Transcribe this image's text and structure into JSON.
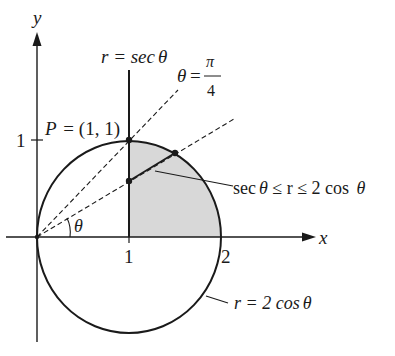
{
  "figure": {
    "axes": {
      "x_label": "x",
      "y_label": "y",
      "x_ticks": [
        {
          "value": 1,
          "label": "1"
        },
        {
          "value": 2,
          "label": "2"
        }
      ],
      "y_ticks": [
        {
          "value": 1,
          "label": "1"
        }
      ]
    },
    "curves": {
      "line_label_lhs": "r = sec",
      "line_label_theta": "θ",
      "circle_label_lhs": "r = 2 cos",
      "circle_label_theta": "θ"
    },
    "rays": {
      "quarter_pi_label_theta": "θ",
      "quarter_pi_label_eq": "=",
      "quarter_pi_num": "π",
      "quarter_pi_den": "4",
      "angle_label": "θ"
    },
    "point": {
      "label": "P = (1, 1)"
    },
    "region": {
      "label_part1": "sec",
      "label_theta1": "θ",
      "label_part2": " ≤ r ≤ 2 cos ",
      "label_theta2": "θ",
      "fill_color": "#d8d8d8"
    },
    "colors": {
      "stroke": "#1a1a1a",
      "shade": "#d8d8d8"
    }
  }
}
